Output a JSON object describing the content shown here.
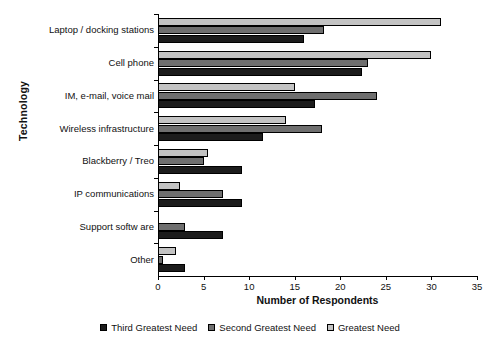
{
  "chart_data": {
    "type": "bar",
    "orientation": "horizontal",
    "title": "",
    "xlabel": "Number of Respondents",
    "ylabel": "Technology",
    "xlim": [
      0,
      35
    ],
    "xticks": [
      0,
      5,
      10,
      15,
      20,
      25,
      30,
      35
    ],
    "grid": false,
    "legend_position": "bottom",
    "categories": [
      "Laptop / docking stations",
      "Cell phone",
      "IM, e-mail, voice mail",
      "Wireless infrastructure",
      "Blackberry / Treo",
      "IP communications",
      "Support softw are",
      "Other"
    ],
    "series": [
      {
        "name": "Greatest Need",
        "color": "#c3c3c3",
        "values": [
          31,
          30,
          15,
          14,
          5.5,
          2.4,
          0,
          2
        ]
      },
      {
        "name": "Second Greatest Need",
        "color": "#6f6f6f",
        "values": [
          18.2,
          23,
          24,
          18,
          5,
          7.1,
          3,
          0.5
        ]
      },
      {
        "name": "Third Greatest Need",
        "color": "#1c1c1c",
        "values": [
          16,
          22.4,
          17.2,
          11.5,
          9.2,
          9.2,
          7.1,
          3
        ]
      }
    ]
  }
}
